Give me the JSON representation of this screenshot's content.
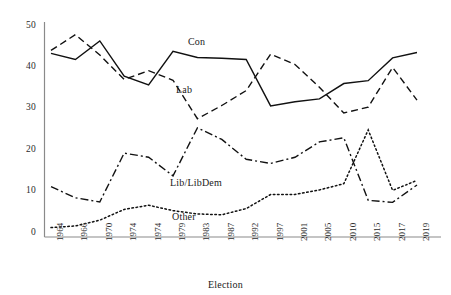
{
  "chart_data": {
    "type": "line",
    "title": "",
    "xlabel": "Election",
    "ylabel": "",
    "ylim": [
      0,
      50
    ],
    "yticks": [
      0,
      10,
      20,
      30,
      40,
      50
    ],
    "grid": false,
    "legend_position": "inline-annotations",
    "categories": [
      "1964",
      "1966",
      "1970",
      "1974",
      "1974",
      "1979",
      "1983",
      "1987",
      "1992",
      "1997",
      "2001",
      "2005",
      "2010",
      "2015",
      "2017",
      "2019"
    ],
    "series": [
      {
        "name": "Con",
        "label": "Con",
        "line_style": "solid",
        "values": [
          43.4,
          41.9,
          46.4,
          37.9,
          35.8,
          43.9,
          42.4,
          42.2,
          41.9,
          30.7,
          31.7,
          32.4,
          36.1,
          36.8,
          42.3,
          43.6
        ]
      },
      {
        "name": "Lab",
        "label": "Lab",
        "line_style": "dashed",
        "values": [
          44.1,
          47.9,
          43.0,
          37.1,
          39.2,
          36.9,
          27.6,
          30.8,
          34.4,
          43.2,
          40.7,
          35.2,
          29.0,
          30.4,
          40.0,
          32.1
        ]
      },
      {
        "name": "Lib/LibDem",
        "label": "Lib/LibDem",
        "line_style": "dash-dot",
        "values": [
          11.2,
          8.5,
          7.5,
          19.3,
          18.3,
          13.8,
          25.4,
          22.6,
          17.8,
          16.8,
          18.3,
          22.0,
          23.0,
          7.9,
          7.4,
          11.6
        ]
      },
      {
        "name": "Other",
        "label": "Other",
        "line_style": "dotted",
        "values": [
          1.3,
          1.7,
          3.1,
          5.7,
          6.7,
          5.4,
          4.6,
          4.4,
          5.9,
          9.3,
          9.3,
          10.4,
          11.9,
          24.9,
          10.3,
          12.7
        ]
      }
    ]
  },
  "axis": {
    "x_title": "Election",
    "y_tick_labels": [
      "50",
      "40",
      "30",
      "20",
      "10",
      "0"
    ],
    "x_tick_labels": [
      "1964",
      "1966",
      "1970",
      "1974",
      "1974",
      "1979",
      "1983",
      "1987",
      "1992",
      "1997",
      "2001",
      "2005",
      "2010",
      "2015",
      "2017",
      "2019"
    ]
  },
  "annotations": [
    {
      "name": "con-label",
      "text": "Con"
    },
    {
      "name": "lab-label",
      "text": "Lab"
    },
    {
      "name": "lib-label",
      "text": "Lib/LibDem"
    },
    {
      "name": "other-label",
      "text": "Other"
    }
  ],
  "colors": {
    "line": "#111111",
    "axis": "#8a8a8a",
    "text": "#1a1a1a",
    "background": "#ffffff"
  }
}
